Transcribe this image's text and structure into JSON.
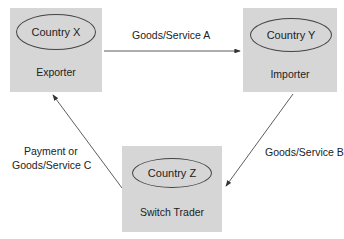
{
  "diagram": {
    "nodes": [
      {
        "id": "x",
        "country": "Country X",
        "role": "Exporter"
      },
      {
        "id": "y",
        "country": "Country Y",
        "role": "Importer"
      },
      {
        "id": "z",
        "country": "Country Z",
        "role": "Switch Trader"
      }
    ],
    "edges": [
      {
        "from": "x",
        "to": "y",
        "label": "Goods/Service A"
      },
      {
        "from": "y",
        "to": "z",
        "label": "Goods/Service B"
      },
      {
        "from": "z",
        "to": "x",
        "label_line1": "Payment or",
        "label_line2": "Goods/Service C"
      }
    ],
    "colors": {
      "box_fill": "#d6d6d6",
      "line": "#333333",
      "text": "#222222"
    }
  }
}
